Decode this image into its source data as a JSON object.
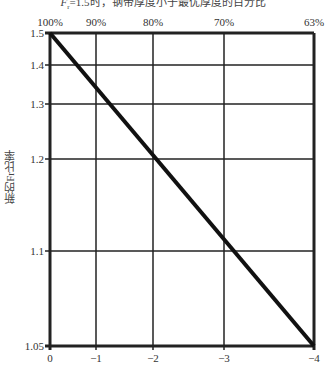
{
  "chart_data": {
    "type": "line",
    "xlabel": "",
    "ylabel": "新的F_r比率",
    "x_ticks_bottom": [
      "0",
      "−1",
      "−2",
      "−3",
      "−4"
    ],
    "x_ticks_top": [
      "100%",
      "90%",
      "80%",
      "70%",
      "63%"
    ],
    "y_ticks": [
      "1.5",
      "1.4",
      "1.3",
      "1.2",
      "1.1",
      "1.05"
    ],
    "xlim": [
      0,
      -4
    ],
    "ylim": [
      1.05,
      1.5
    ],
    "grid": true,
    "series": [
      {
        "name": "新的F_r比率",
        "x": [
          0,
          -1,
          -2,
          -3,
          -4
        ],
        "y": [
          1.5,
          1.33,
          1.2,
          1.1,
          1.05
        ]
      }
    ]
  },
  "title_prefix": "F",
  "title_sub": "r",
  "title_rest": "=1.5时，钢带厚度小于最优厚度的百分比",
  "ylabel_text": "新的Fr比率"
}
